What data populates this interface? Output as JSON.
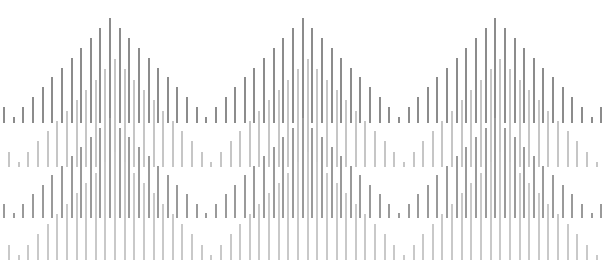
{
  "figure": {
    "width": 606,
    "height": 272,
    "background": "#ffffff"
  },
  "pattern": {
    "step": 9.63,
    "peaks_per_row": 3,
    "peak_spacing": 192.6,
    "half_width_bars": 10,
    "rows": [
      {
        "name": "row-1",
        "baseline": 123,
        "first_peak_x": 109,
        "peak_height": 105,
        "min_height": 6,
        "color": "#8c8c8c"
      },
      {
        "name": "row-2",
        "baseline": 167,
        "first_peak_x": 114,
        "peak_height": 108,
        "min_height": 5,
        "color": "#c6c6c6"
      },
      {
        "name": "row-3",
        "baseline": 218,
        "first_peak_x": 109,
        "peak_height": 100,
        "min_height": 5,
        "color": "#9a9a9a"
      },
      {
        "name": "row-4",
        "baseline": 260,
        "first_peak_x": 114,
        "peak_height": 108,
        "min_height": 5,
        "color": "#c9c9c9"
      }
    ]
  }
}
